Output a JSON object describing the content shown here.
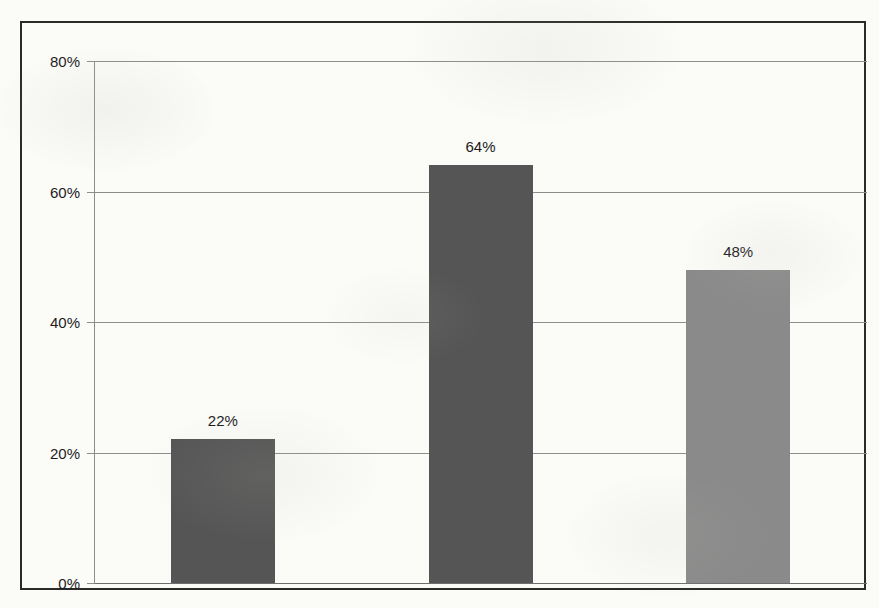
{
  "chart_data": {
    "type": "bar",
    "title": "",
    "subtitle": "",
    "xlabel": "",
    "ylabel": "",
    "categories": [
      "Deutschland",
      "Schweiz",
      "Gesamtkollektiv"
    ],
    "values": [
      22,
      64,
      48
    ],
    "value_labels": [
      "22%",
      "64%",
      "48%"
    ],
    "series": [
      {
        "name": "",
        "values": [
          22,
          64,
          48
        ]
      }
    ],
    "ylim": [
      0,
      80
    ],
    "y_ticks": [
      0,
      20,
      40,
      60,
      80
    ],
    "y_tick_labels": [
      "0%",
      "20%",
      "40%",
      "60%",
      "80%"
    ],
    "grid": true,
    "legend": false,
    "legend_position": "none",
    "unit": "%",
    "bar_colors": [
      "#555555",
      "#555555",
      "#8a8a8a"
    ],
    "colors": {
      "bar_dark": "#555555",
      "bar_light": "#8a8a8a",
      "gridline": "#8d8d8d",
      "axis": "#8d8d8d",
      "frame_border": "#2a2a2a",
      "text": "#1c1c1c",
      "background": "#fbfbf8"
    }
  }
}
